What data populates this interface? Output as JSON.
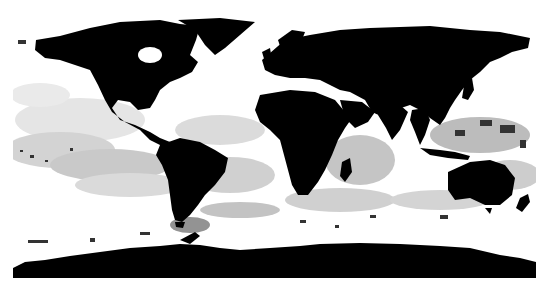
{
  "map": {
    "projection": "equirectangular",
    "description": "Global satellite composite with black land masses and white/gray cloud and ocean cover",
    "colors": {
      "background": "#ffffff",
      "land": "#000000",
      "cloud_light": "#e6e6e6",
      "cloud_mid": "#bdbdbd",
      "cloud_dark": "#8c8c8c"
    },
    "regions": [
      {
        "name": "North America"
      },
      {
        "name": "Greenland"
      },
      {
        "name": "South America"
      },
      {
        "name": "Europe-Asia"
      },
      {
        "name": "Africa"
      },
      {
        "name": "Madagascar"
      },
      {
        "name": "Arabian Peninsula"
      },
      {
        "name": "India"
      },
      {
        "name": "Southeast Asia"
      },
      {
        "name": "Japan"
      },
      {
        "name": "Australia"
      },
      {
        "name": "New Zealand"
      },
      {
        "name": "Antarctica"
      }
    ]
  }
}
